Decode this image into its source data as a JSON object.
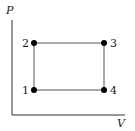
{
  "diagram": {
    "type": "pv-cycle",
    "axes": {
      "y_label": "P",
      "x_label": "V",
      "origin": [
        12,
        115
      ],
      "y_top": 20,
      "x_right": 125
    },
    "points": [
      {
        "id": "1",
        "label": "1",
        "x": 34,
        "y": 90,
        "label_side": "left"
      },
      {
        "id": "2",
        "label": "2",
        "x": 34,
        "y": 43,
        "label_side": "left"
      },
      {
        "id": "3",
        "label": "3",
        "x": 104,
        "y": 43,
        "label_side": "right"
      },
      {
        "id": "4",
        "label": "4",
        "x": 104,
        "y": 90,
        "label_side": "right"
      }
    ],
    "edges": [
      {
        "from": "1",
        "to": "2"
      },
      {
        "from": "2",
        "to": "3"
      },
      {
        "from": "3",
        "to": "4"
      },
      {
        "from": "4",
        "to": "1"
      }
    ],
    "colors": {
      "axis": "#333333",
      "edge": "#555555",
      "point": "#000000",
      "text": "#1a1a1a"
    }
  }
}
